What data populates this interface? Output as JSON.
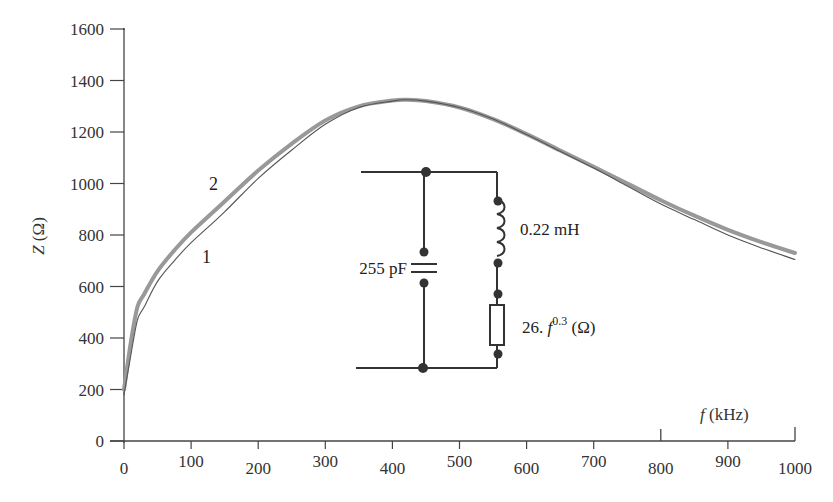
{
  "chart_data": {
    "type": "line",
    "title": "",
    "xlabel": "f (kHz)",
    "ylabel": "Z (Ω)",
    "xlim": [
      0,
      1000
    ],
    "ylim": [
      0,
      1600
    ],
    "grid": false,
    "x_ticks": [
      0,
      100,
      200,
      300,
      400,
      500,
      600,
      700,
      800,
      900,
      1000
    ],
    "x_tick_labels": [
      "0",
      "100",
      "200",
      "300",
      "400",
      "500",
      "600",
      "700",
      "800",
      "900",
      "1000"
    ],
    "y_ticks": [
      0,
      200,
      400,
      600,
      800,
      1000,
      1200,
      1400,
      1600
    ],
    "y_tick_labels": [
      "0",
      "200",
      "400",
      "600",
      "800",
      "1000",
      "1200",
      "1400",
      "1600"
    ],
    "x": [
      0,
      10,
      20,
      30,
      50,
      75,
      100,
      150,
      200,
      250,
      300,
      350,
      400,
      420,
      450,
      500,
      550,
      600,
      650,
      700,
      750,
      800,
      850,
      900,
      950,
      1000
    ],
    "series": [
      {
        "name": "1",
        "style": "thin",
        "color": "#555555",
        "values": [
          180,
          330,
          470,
          520,
          620,
          700,
          770,
          890,
          1020,
          1130,
          1230,
          1295,
          1320,
          1325,
          1320,
          1295,
          1250,
          1190,
          1125,
          1060,
          990,
          920,
          860,
          800,
          750,
          705
        ]
      },
      {
        "name": "2",
        "style": "thick",
        "color": "#999999",
        "values": [
          200,
          380,
          520,
          570,
          660,
          740,
          810,
          930,
          1050,
          1155,
          1245,
          1300,
          1322,
          1325,
          1320,
          1295,
          1250,
          1192,
          1128,
          1065,
          1000,
          935,
          875,
          820,
          772,
          730
        ]
      }
    ],
    "annotations": [
      {
        "text": "1",
        "x": 125,
        "y": 720,
        "target_series": "1"
      },
      {
        "text": "2",
        "x": 140,
        "y": 1005,
        "target_series": "2"
      }
    ],
    "inset": {
      "type": "circuit",
      "description": "Parallel equivalent circuit: capacitor in parallel with series inductor + frequency-dependent resistor",
      "components": [
        {
          "type": "capacitor",
          "label": "255 pF"
        },
        {
          "type": "inductor",
          "label": "0.22 mH"
        },
        {
          "type": "resistor",
          "label": "26.f^0.3 (Ω)"
        }
      ]
    }
  },
  "labels": {
    "y_axis_title_italic": "Z",
    "y_axis_title_unit": " (Ω)",
    "x_axis_title_italic": "f",
    "x_axis_title_unit": " (kHz)",
    "series_1": "1",
    "series_2": "2",
    "capacitor": "255 pF",
    "inductor": "0.22 mH",
    "resistor_prefix": "26. ",
    "resistor_var": "f",
    "resistor_exp": "0.3",
    "resistor_unit": " (Ω)"
  }
}
